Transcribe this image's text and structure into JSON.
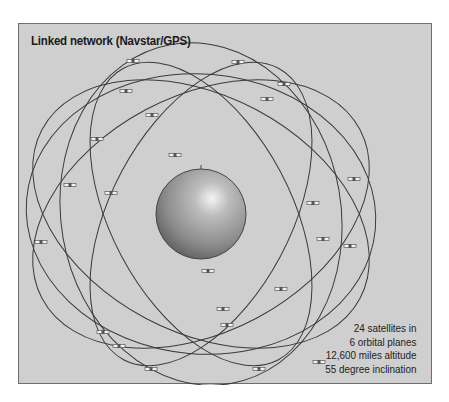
{
  "figure": {
    "title": "Linked network (Navstar/GPS)",
    "caption_lines": [
      "24 satellites in",
      "6 orbital planes",
      "12,600 miles altitude",
      "55 degree inclination"
    ]
  },
  "diagram": {
    "center_object": "Earth globe",
    "orbit_count": 6,
    "satellite_count": 24,
    "colors": {
      "background": "#cfcfcf",
      "orbit_line": "#3a3a3a",
      "globe_light": "#e8e8e8",
      "globe_dark": "#5a5a5a",
      "text": "#1a1a1a"
    }
  }
}
